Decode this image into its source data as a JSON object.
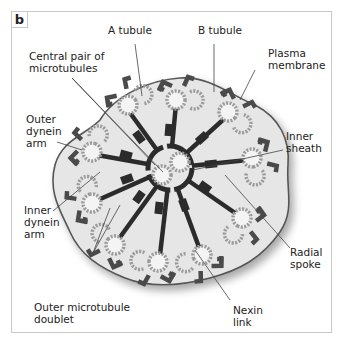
{
  "panel": {
    "label": "b"
  },
  "labels": {
    "a_tubule": "A tubule",
    "b_tubule": "B tubule",
    "plasma_membrane": "Plasma\nmembrane",
    "central_pair": "Central pair of\nmicrotubules",
    "outer_dynein_arm": "Outer\ndynein\narm",
    "inner_sheath": "Inner\nsheath",
    "inner_dynein_arm": "Inner\ndynein\narm",
    "radial_spoke": "Radial\nspoke",
    "outer_microtubule_doublet": "Outer microtubule\ndoublet",
    "nexin_link": "Nexin\nlink"
  },
  "colors": {
    "cytoplasm": "#e6e6e6",
    "membrane": "#555555",
    "dark": "#2b2b2b",
    "arm": "#4a4a4a",
    "tubule_dots": "#9a9a9a"
  }
}
